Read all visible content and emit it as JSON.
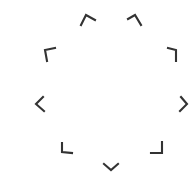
{
  "canvas": {
    "width": 196,
    "height": 180,
    "background": "#ffffff"
  },
  "style": {
    "stroke_color": "#333333",
    "stroke_width": 2.1
  },
  "ring": {
    "description": "radial arrangement of 9 corner/chevron marks",
    "marks": [
      {
        "name": "mark-top-left",
        "shape": "chevron-up-icon",
        "points": [
          [
            81,
            25
          ],
          [
            86,
            15
          ],
          [
            95,
            20
          ]
        ]
      },
      {
        "name": "mark-top-right",
        "shape": "chevron-up-icon",
        "points": [
          [
            128,
            19
          ],
          [
            135,
            15
          ],
          [
            141,
            25
          ]
        ]
      },
      {
        "name": "mark-upper-left",
        "shape": "corner-top-left-icon",
        "points": [
          [
            55,
            48
          ],
          [
            45,
            50
          ],
          [
            47,
            61
          ]
        ]
      },
      {
        "name": "mark-upper-right",
        "shape": "corner-top-right-icon",
        "points": [
          [
            168,
            48
          ],
          [
            176,
            50
          ],
          [
            176,
            61
          ]
        ]
      },
      {
        "name": "mark-left",
        "shape": "chevron-left-icon",
        "points": [
          [
            43,
            97
          ],
          [
            36,
            104
          ],
          [
            44,
            111
          ]
        ]
      },
      {
        "name": "mark-right",
        "shape": "chevron-right-icon",
        "points": [
          [
            181,
            97
          ],
          [
            187,
            104
          ],
          [
            180,
            111
          ]
        ]
      },
      {
        "name": "mark-lower-left",
        "shape": "corner-bottom-left-icon",
        "points": [
          [
            62,
            143
          ],
          [
            62,
            152
          ],
          [
            72,
            153
          ]
        ]
      },
      {
        "name": "mark-lower-right",
        "shape": "corner-bottom-right-icon",
        "points": [
          [
            162,
            142
          ],
          [
            162,
            153
          ],
          [
            151,
            153
          ]
        ]
      },
      {
        "name": "mark-bottom",
        "shape": "chevron-down-icon",
        "points": [
          [
            104,
            164
          ],
          [
            111,
            170
          ],
          [
            118,
            164
          ]
        ]
      }
    ]
  }
}
